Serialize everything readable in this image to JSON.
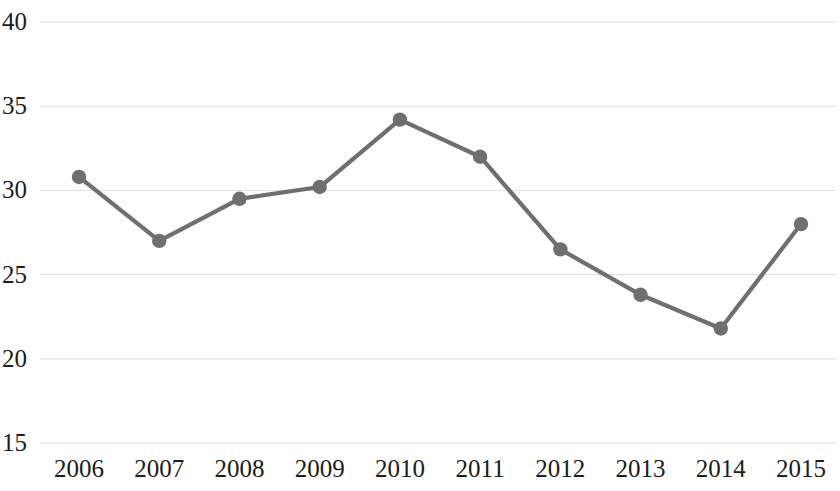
{
  "chart_data": {
    "type": "line",
    "title": "",
    "subtitle": "",
    "xlabel": "",
    "ylabel": "",
    "categories": [
      "2006",
      "2007",
      "2008",
      "2009",
      "2010",
      "2011",
      "2012",
      "2013",
      "2014",
      "2015"
    ],
    "values": [
      30.8,
      27.0,
      29.5,
      30.2,
      34.2,
      32.0,
      26.5,
      23.8,
      21.8,
      28.0
    ],
    "series": [
      {
        "name": "",
        "values": [
          30.8,
          27.0,
          29.5,
          30.2,
          34.2,
          32.0,
          26.5,
          23.8,
          21.8,
          28.0
        ]
      }
    ],
    "ylim": [
      15,
      40
    ],
    "yticks": [
      15,
      20,
      25,
      30,
      35,
      40
    ],
    "ytick_labels": [
      "15",
      "20",
      "25",
      "30",
      "35",
      "40"
    ],
    "xtick_labels": [
      "2006",
      "2007",
      "2008",
      "2009",
      "2010",
      "2011",
      "2012",
      "2013",
      "2014",
      "2015"
    ],
    "grid": "horizontal",
    "legend": "none",
    "line_color": "#6f6f6f",
    "marker_color": "#6f6f6f",
    "marker_shape": "circle",
    "gridline_color": "#dedede",
    "background_color": "#ffffff",
    "text_color": "#1c1c1c",
    "annotations": []
  },
  "axes": {
    "y_ticks": [
      {
        "label": "40",
        "value": 40
      },
      {
        "label": "35",
        "value": 35
      },
      {
        "label": "30",
        "value": 30
      },
      {
        "label": "25",
        "value": 25
      },
      {
        "label": "20",
        "value": 20
      },
      {
        "label": "15",
        "value": 15
      }
    ],
    "x_ticks": [
      {
        "label": "2006",
        "value": 2006
      },
      {
        "label": "2007",
        "value": 2007
      },
      {
        "label": "2008",
        "value": 2008
      },
      {
        "label": "2009",
        "value": 2009
      },
      {
        "label": "2010",
        "value": 2010
      },
      {
        "label": "2011",
        "value": 2011
      },
      {
        "label": "2012",
        "value": 2012
      },
      {
        "label": "2013",
        "value": 2013
      },
      {
        "label": "2014",
        "value": 2014
      },
      {
        "label": "2015",
        "value": 2015
      }
    ]
  }
}
